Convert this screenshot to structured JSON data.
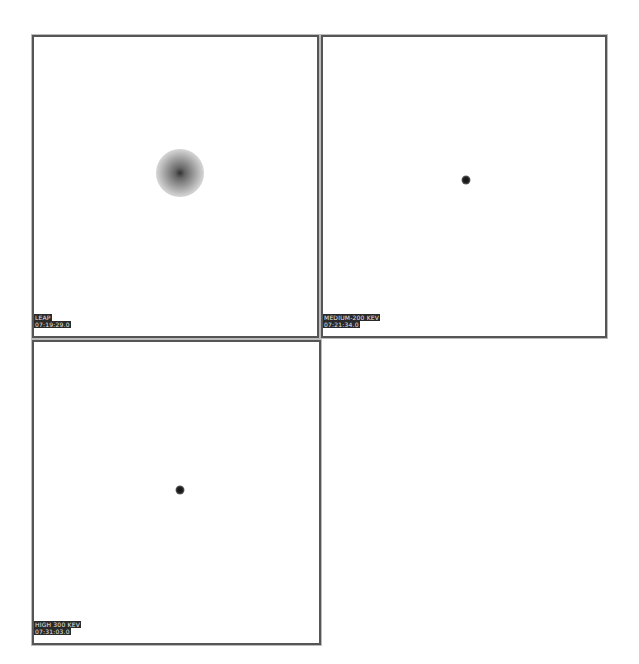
{
  "panels": [
    {
      "id": "top-left",
      "name": "LEAP",
      "time": "07:19:29.0",
      "source": "diffuse",
      "left": 32,
      "top": 35,
      "width": 287,
      "height": 303,
      "source_x": 146,
      "source_y": 136
    },
    {
      "id": "top-right",
      "name": "MEDIUM-200 KEV",
      "time": "07:21:34.0",
      "source": "point",
      "left": 321,
      "top": 35,
      "width": 286,
      "height": 303,
      "source_x": 143,
      "source_y": 143
    },
    {
      "id": "bottom-left",
      "name": "HIGH 300 KEV",
      "time": "07:31:03.0",
      "source": "point",
      "left": 32,
      "top": 340,
      "width": 289,
      "height": 305,
      "source_x": 146,
      "source_y": 148
    }
  ],
  "colors": {
    "border": "#555555",
    "label_bg": "#2a2a2a",
    "label_text": "#e8e8e8",
    "background": "#ffffff"
  }
}
